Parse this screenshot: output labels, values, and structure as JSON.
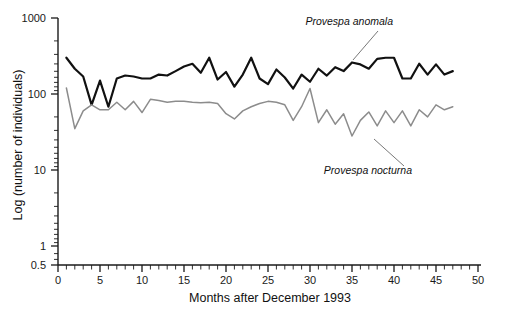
{
  "chart_data": {
    "type": "line",
    "title": "",
    "xlabel": "Months after December 1993",
    "ylabel": "Log (number of individuals)",
    "yscale": "log",
    "ylim": [
      0.5,
      1000
    ],
    "xlim": [
      0,
      50
    ],
    "grid": false,
    "legend_position": "inline-annotation",
    "x_ticks": [
      0,
      5,
      10,
      15,
      20,
      25,
      30,
      35,
      40,
      45,
      50
    ],
    "x_tick_labels": [
      "0",
      "5",
      "10",
      "15",
      "20",
      "25",
      "30",
      "35",
      "40",
      "45",
      "50"
    ],
    "y_ticks": [
      0.5,
      1,
      10,
      100,
      1000
    ],
    "y_tick_labels": [
      "0.5",
      "1",
      "10",
      "100",
      "1000"
    ],
    "x": [
      1,
      2,
      3,
      4,
      5,
      6,
      7,
      8,
      9,
      10,
      11,
      12,
      13,
      14,
      15,
      16,
      17,
      18,
      19,
      20,
      21,
      22,
      23,
      24,
      25,
      26,
      27,
      28,
      29,
      30,
      31,
      32,
      33,
      34,
      35,
      36,
      37,
      38,
      39,
      40,
      41,
      42,
      43,
      44,
      45,
      46,
      47
    ],
    "series": [
      {
        "name": "Provespa anomala",
        "color": "#111111",
        "style": "solid",
        "width": 2.2,
        "values": [
          300,
          215,
          170,
          72,
          150,
          68,
          160,
          175,
          170,
          160,
          160,
          180,
          175,
          200,
          230,
          250,
          190,
          300,
          155,
          195,
          125,
          180,
          300,
          160,
          135,
          210,
          165,
          118,
          180,
          145,
          215,
          175,
          225,
          200,
          260,
          245,
          215,
          290,
          300,
          300,
          160,
          160,
          250,
          180,
          245,
          180,
          200
        ],
        "label_text": "Provespa anomala"
      },
      {
        "name": "Provespa nocturna",
        "color": "#8c8c8c",
        "style": "solid",
        "width": 1.5,
        "values": [
          120,
          35,
          60,
          72,
          62,
          62,
          78,
          62,
          80,
          57,
          85,
          82,
          78,
          80,
          80,
          78,
          77,
          78,
          75,
          55,
          47,
          60,
          68,
          75,
          80,
          78,
          72,
          45,
          68,
          118,
          42,
          62,
          40,
          55,
          28,
          45,
          58,
          38,
          60,
          42,
          60,
          38,
          62,
          50,
          72,
          62,
          68
        ],
        "label_text": "Provespa nocturna"
      }
    ],
    "annotations": [
      {
        "name": "provespa-anomala-label",
        "text": "Provespa anomala",
        "text_x": 393,
        "text_y": 25,
        "leader_from_x": 378,
        "leader_from_y": 31,
        "leader_to_x": 353,
        "leader_to_y": 60
      },
      {
        "name": "provespa-nocturna-label",
        "text": "Provespa nocturna",
        "text_x": 412,
        "text_y": 174,
        "leader_from_x": 404,
        "leader_from_y": 166,
        "leader_to_x": 374,
        "leader_to_y": 139
      }
    ]
  }
}
